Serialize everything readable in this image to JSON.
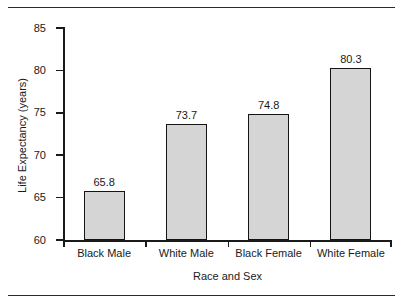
{
  "chart_data": {
    "type": "bar",
    "title": "",
    "xlabel": "Race and Sex",
    "ylabel": "Life Expectancy (years)",
    "categories": [
      "Black Male",
      "White Male",
      "Black Female",
      "White Female"
    ],
    "values": [
      65.8,
      73.7,
      74.8,
      80.3
    ],
    "value_labels": [
      "65.8",
      "73.7",
      "74.8",
      "80.3"
    ],
    "ylim": [
      60,
      85
    ],
    "yticks": [
      60,
      65,
      70,
      75,
      80,
      85
    ],
    "ytick_labels": [
      "60",
      "65",
      "70",
      "75",
      "80",
      "85"
    ],
    "grid": false,
    "legend": "none",
    "bar_fill": "#d5d5d5",
    "bar_edge": "#141414",
    "axis_color": "#1a1a1a"
  }
}
